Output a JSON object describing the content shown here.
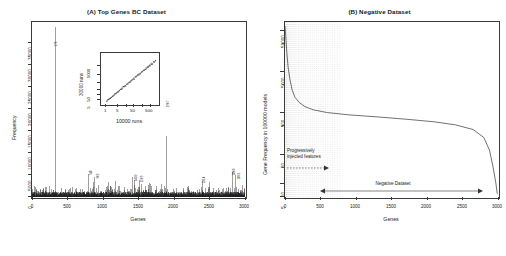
{
  "figure": {
    "panels": [
      {
        "id": "A",
        "title": "(A) Top Genes BC Dataset",
        "xlabel": "Genes",
        "ylabel": "Frequency"
      },
      {
        "id": "B",
        "title": "(B) Negative Dataset",
        "xlabel": "Genes",
        "ylabel": "Gene Frequency in 100000 models"
      }
    ]
  },
  "chart_data": [
    {
      "type": "bar",
      "panel": "A",
      "title": "(A) Top Genes BC Dataset",
      "xlabel": "Genes",
      "ylabel": "Frequency",
      "xlim": [
        0,
        3000
      ],
      "ylim": [
        0,
        37000
      ],
      "xticks": [
        0,
        500,
        1000,
        1500,
        2000,
        2500,
        3000
      ],
      "yticks": [
        0,
        5000,
        10000,
        15000,
        20000,
        25000,
        30000,
        35000
      ],
      "grid": false,
      "legend": "none",
      "description": "Dense spike/needle plot of gene frequency across ~3000 genes, with a single dominant spike near gene index 330 reaching ~36000 and many smaller labelled peaks.",
      "labeled_peaks": [
        {
          "x": 330,
          "y": 36000,
          "label": "173"
        },
        {
          "x": 800,
          "y": 4900,
          "label": "748"
        },
        {
          "x": 880,
          "y": 4300,
          "label": "902"
        },
        {
          "x": 1450,
          "y": 3650,
          "label": "1450"
        },
        {
          "x": 1510,
          "y": 3500,
          "label": "1509"
        },
        {
          "x": 1900,
          "y": 12800,
          "label": "1907"
        },
        {
          "x": 2400,
          "y": 3400,
          "label": "2314"
        },
        {
          "x": 2830,
          "y": 5200,
          "label": "2803"
        },
        {
          "x": 2870,
          "y": 4600,
          "label": "2861"
        }
      ],
      "inset": {
        "type": "scatter",
        "xlabel": "10000 runs",
        "ylabel": "30000 runs",
        "xscale": "log",
        "yscale": "log",
        "xticks": [
          1,
          5,
          50,
          500
        ],
        "yticks": [
          5,
          50,
          5000
        ],
        "description": "Log-log scatter of gene frequency at 10000 runs versus 30000 runs showing a tight near-linear relationship."
      }
    },
    {
      "type": "line",
      "panel": "B",
      "title": "(B) Negative Dataset",
      "xlabel": "Genes",
      "ylabel": "Gene Frequency in 100000 models",
      "xlim": [
        0,
        3000
      ],
      "yscale": "log",
      "xticks": [
        0,
        500,
        1000,
        1500,
        2000,
        2500,
        3000
      ],
      "yticks": [
        5,
        10,
        50,
        500,
        5000,
        50000
      ],
      "grid": true,
      "legend": "none",
      "description": "Monotonically decreasing ranked frequency curve on a log y-axis, starting near 50000, plateauing around 300-500 across the middle range, then dropping steeply after gene 2800 toward 5.",
      "points": [
        {
          "x": 0,
          "y": 50000
        },
        {
          "x": 10,
          "y": 30000
        },
        {
          "x": 25,
          "y": 12000
        },
        {
          "x": 45,
          "y": 5000
        },
        {
          "x": 70,
          "y": 2600
        },
        {
          "x": 100,
          "y": 1500
        },
        {
          "x": 140,
          "y": 1000
        },
        {
          "x": 200,
          "y": 750
        },
        {
          "x": 280,
          "y": 600
        },
        {
          "x": 400,
          "y": 500
        },
        {
          "x": 600,
          "y": 430
        },
        {
          "x": 900,
          "y": 380
        },
        {
          "x": 1300,
          "y": 340
        },
        {
          "x": 1700,
          "y": 300
        },
        {
          "x": 2100,
          "y": 260
        },
        {
          "x": 2400,
          "y": 220
        },
        {
          "x": 2650,
          "y": 170
        },
        {
          "x": 2800,
          "y": 110
        },
        {
          "x": 2880,
          "y": 55
        },
        {
          "x": 2930,
          "y": 22
        },
        {
          "x": 2970,
          "y": 9
        },
        {
          "x": 2990,
          "y": 5
        }
      ],
      "annotations": [
        {
          "name": "injected-features",
          "text_line1": "Progressively",
          "text_line2": "injected features",
          "arrow": "right-dashed"
        },
        {
          "name": "negative-dataset-range",
          "text": "Negative Dataset",
          "arrow": "double-headed"
        }
      ]
    }
  ]
}
